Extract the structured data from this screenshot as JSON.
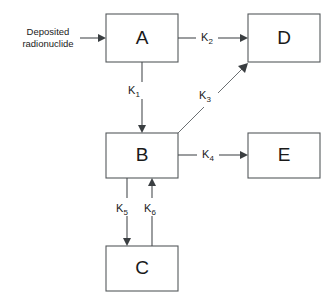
{
  "diagram": {
    "canvas": {
      "width": 333,
      "height": 303
    },
    "colors": {
      "background": "#ffffff",
      "box_stroke": "#55595c",
      "line_stroke": "#4a4e51",
      "text": "#1a1a1a"
    },
    "source_label": {
      "line1": "Deposited",
      "line2": "radionuclide"
    },
    "compartments": [
      {
        "id": "A",
        "label": "A",
        "x": 106,
        "y": 14,
        "w": 72,
        "h": 48
      },
      {
        "id": "D",
        "label": "D",
        "x": 248,
        "y": 14,
        "w": 72,
        "h": 48
      },
      {
        "id": "B",
        "label": "B",
        "x": 106,
        "y": 133,
        "w": 72,
        "h": 45
      },
      {
        "id": "E",
        "label": "E",
        "x": 248,
        "y": 133,
        "w": 72,
        "h": 45
      },
      {
        "id": "C",
        "label": "C",
        "x": 106,
        "y": 246,
        "w": 72,
        "h": 45
      }
    ],
    "transfers": [
      {
        "id": "k1",
        "base": "K",
        "subscript": "1",
        "from": "A",
        "to": "B",
        "label": "K1"
      },
      {
        "id": "k2",
        "base": "K",
        "subscript": "2",
        "from": "A",
        "to": "D",
        "label": "K2"
      },
      {
        "id": "k3",
        "base": "K",
        "subscript": "3",
        "from": "B",
        "to": "D",
        "label": "K3"
      },
      {
        "id": "k4",
        "base": "K",
        "subscript": "4",
        "from": "B",
        "to": "E",
        "label": "K4"
      },
      {
        "id": "k5",
        "base": "K",
        "subscript": "5",
        "from": "B",
        "to": "C",
        "label": "K5"
      },
      {
        "id": "k6",
        "base": "K",
        "subscript": "6",
        "from": "C",
        "to": "B",
        "label": "K6"
      }
    ]
  }
}
